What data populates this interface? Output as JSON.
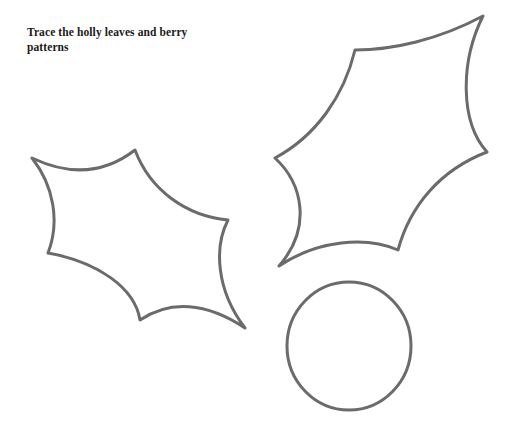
{
  "worksheet": {
    "title": "Trace the holly leaves and berry patterns",
    "instruction": "Trace the holly leaves and berry\npatterns",
    "background_color": "#ffffff",
    "text_color": "#1a1a1a"
  },
  "style": {
    "outline_color": "#6b6b6b",
    "outline_width": "3",
    "fill": "none"
  },
  "shapes": [
    {
      "name": "holly-leaf-small",
      "label": "Small holly leaf",
      "type": "holly-leaf",
      "points": "32,158 135,150 228,220 245,328 140,320 48,253",
      "path": "M32,158 C70,176 104,174 135,150 C150,190 186,216 228,220 C214,247 216,290 245,328 C206,302 170,300 140,320 C135,288 98,262 48,253 C60,222 54,186 32,158 Z"
    },
    {
      "name": "holly-leaf-large",
      "label": "Large holly leaf",
      "type": "holly-leaf",
      "points": "483,16 355,50 275,158 279,266 398,250 487,152",
      "path": "M483,16 C438,40 392,50 355,50 C344,96 316,136 275,158 C303,184 312,228 279,266 C318,240 366,236 398,250 C410,206 440,170 487,152 C460,122 460,62 483,16 Z"
    },
    {
      "name": "holly-berry",
      "label": "Holly berry",
      "type": "circle",
      "cx": "349",
      "cy": "346",
      "rx": "62",
      "ry": "64"
    }
  ]
}
